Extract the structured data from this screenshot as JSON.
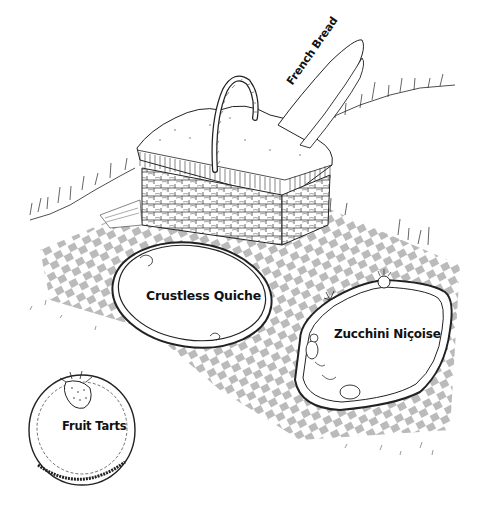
{
  "illustration": {
    "style": "black-and-white pen-and-ink line drawing",
    "scene": "picnic on a checkered blanket on grass",
    "ink_color": "#111111",
    "background_color": "#ffffff"
  },
  "items": {
    "french_bread": {
      "label": "French Bread"
    },
    "crustless_quiche": {
      "label": "Crustless Quiche"
    },
    "zucchini_nicoise": {
      "label": "Zucchini Niçoise"
    },
    "fruit_tarts": {
      "label": "Fruit Tarts"
    }
  }
}
